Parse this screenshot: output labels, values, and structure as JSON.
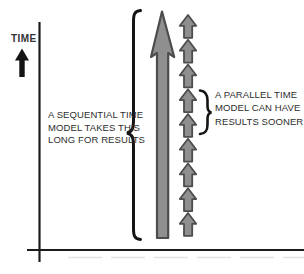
{
  "figure": {
    "background": "#ffffff",
    "line_color": "#1c1c1c",
    "arrow_fill": "#8f8f8f",
    "arrow_stroke": "#4d4d4d",
    "ink_color": "#141414",
    "faint_edge_color": "#dedede",
    "parallel_arrow_count": 9
  },
  "axis": {
    "time_label": "TIME"
  },
  "sequential_annotation": {
    "lines": [
      "A SEQUENTIAL TIME",
      "MODEL TAKES THIS",
      "LONG FOR RESULTS"
    ]
  },
  "parallel_annotation": {
    "lines": [
      "A PARALLEL TIME",
      "MODEL CAN HAVE",
      "RESULTS SOONER"
    ]
  }
}
